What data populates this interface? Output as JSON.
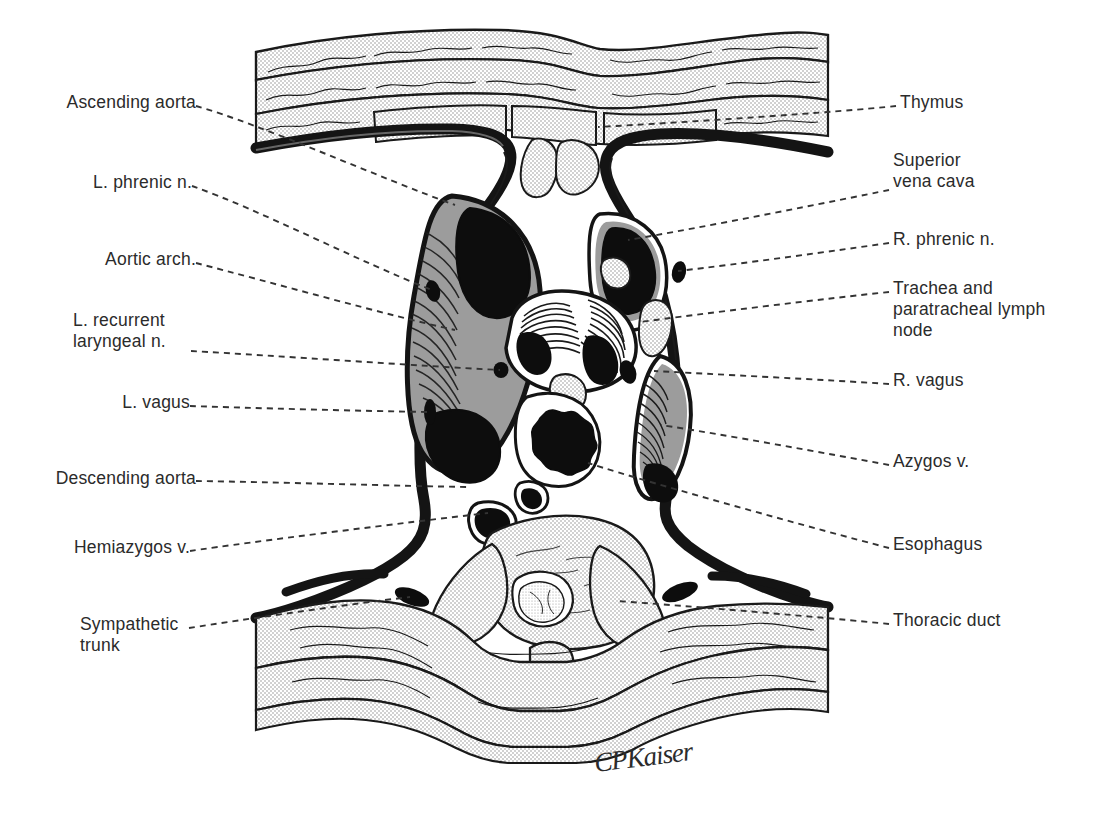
{
  "figure": {
    "artist_signature": "CPKaiser",
    "ink_color": "#1a1a1a",
    "fill_gray": "#9a9a9a",
    "stipple_gray": "#d9d9d9",
    "background": "#ffffff"
  },
  "labels_left": [
    {
      "id": "ascending-aorta",
      "text": "Ascending aorta",
      "x": 35,
      "y": 92,
      "anchor_x": 196,
      "anchor_y": 106,
      "target_x": 455,
      "target_y": 205
    },
    {
      "id": "l-phrenic-n",
      "text": "L. phrenic n.",
      "x": 78,
      "y": 172,
      "anchor_x": 192,
      "anchor_y": 186,
      "target_x": 432,
      "target_y": 290
    },
    {
      "id": "aortic-arch",
      "text": "Aortic arch.",
      "x": 88,
      "y": 249,
      "anchor_x": 196,
      "anchor_y": 263,
      "target_x": 455,
      "target_y": 330
    },
    {
      "id": "l-recurrent-laryngeal",
      "text": "L. recurrent\nlaryngeal n.",
      "x": 73,
      "y": 310,
      "anchor_x": 191,
      "anchor_y": 351,
      "target_x": 500,
      "target_y": 370
    },
    {
      "id": "l-vagus",
      "text": "L. vagus",
      "x": 113,
      "y": 392,
      "anchor_x": 190,
      "anchor_y": 406,
      "target_x": 430,
      "target_y": 412
    },
    {
      "id": "descending-aorta",
      "text": "Descending aorta",
      "x": 28,
      "y": 468,
      "anchor_x": 196,
      "anchor_y": 481,
      "target_x": 470,
      "target_y": 487
    },
    {
      "id": "hemiazygos-v",
      "text": "Hemiazygos v.",
      "x": 58,
      "y": 537,
      "anchor_x": 190,
      "anchor_y": 551,
      "target_x": 488,
      "target_y": 513
    },
    {
      "id": "sympathetic-trunk",
      "text": "Sympathetic\ntrunk",
      "x": 80,
      "y": 614,
      "anchor_x": 189,
      "anchor_y": 628,
      "target_x": 410,
      "target_y": 597
    }
  ],
  "labels_right": [
    {
      "id": "thymus",
      "text": "Thymus",
      "x": 900,
      "y": 92,
      "anchor_x": 896,
      "anchor_y": 106,
      "target_x": 598,
      "target_y": 127
    },
    {
      "id": "superior-vena-cava",
      "text": "Superior\nvena cava",
      "x": 893,
      "y": 150,
      "anchor_x": 889,
      "anchor_y": 190,
      "target_x": 628,
      "target_y": 240
    },
    {
      "id": "r-phrenic-n",
      "text": "R. phrenic n.",
      "x": 893,
      "y": 229,
      "anchor_x": 889,
      "anchor_y": 243,
      "target_x": 678,
      "target_y": 271
    },
    {
      "id": "trachea-paratracheal",
      "text": "Trachea and\nparatracheal lymph\nnode",
      "x": 893,
      "y": 278,
      "anchor_x": 889,
      "anchor_y": 292,
      "target_x": 640,
      "target_y": 322
    },
    {
      "id": "r-vagus",
      "text": "R. vagus",
      "x": 893,
      "y": 370,
      "anchor_x": 889,
      "anchor_y": 384,
      "target_x": 654,
      "target_y": 371
    },
    {
      "id": "azygos-v",
      "text": "Azygos v.",
      "x": 893,
      "y": 451,
      "anchor_x": 889,
      "anchor_y": 465,
      "target_x": 661,
      "target_y": 425
    },
    {
      "id": "esophagus",
      "text": "Esophagus",
      "x": 893,
      "y": 534,
      "anchor_x": 889,
      "anchor_y": 548,
      "target_x": 588,
      "target_y": 463
    },
    {
      "id": "thoracic-duct",
      "text": "Thoracic duct",
      "x": 893,
      "y": 610,
      "anchor_x": 889,
      "anchor_y": 624,
      "target_x": 616,
      "target_y": 601
    }
  ]
}
